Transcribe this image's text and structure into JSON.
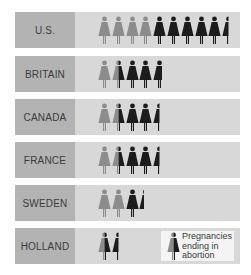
{
  "chart_data": {
    "type": "pictogram",
    "title": "",
    "unit_note": "each figure = one unit of pregnancies; grey = births, black = ending in abortion",
    "colors": {
      "label_bg": "#b3b3b3",
      "bar_bg": "#d8d8d8",
      "births": "#8c8c8c",
      "abortion": "#1c1c1c",
      "legend_bg": "#f4f4f4"
    },
    "categories": [
      "U.S.",
      "BRITAIN",
      "CANADA",
      "FRANCE",
      "SWEDEN",
      "HOLLAND"
    ],
    "series": [
      {
        "name": "Births (grey)",
        "values": [
          4,
          1.5,
          1.5,
          1.5,
          2,
          0.5
        ]
      },
      {
        "name": "Pregnancies ending in abortion (black)",
        "values": [
          5.5,
          2.7,
          2.5,
          2.5,
          1.4,
          1.0
        ]
      }
    ],
    "legend": {
      "label": "Pregnancies ending in abortion",
      "lines": [
        "Pregnancies",
        "ending in",
        "abortion"
      ]
    }
  },
  "rows": [
    {
      "label": "U.S.",
      "figures": [
        {
          "g": 1
        },
        {
          "g": 1
        },
        {
          "g": 1
        },
        {
          "g": 1
        },
        {
          "b": 1
        },
        {
          "b": 1
        },
        {
          "b": 1
        },
        {
          "b": 1
        },
        {
          "b": 1
        },
        {
          "b": 0.5
        }
      ]
    },
    {
      "label": "BRITAIN",
      "figures": [
        {
          "g": 1
        },
        {
          "g": 0.5,
          "b": 0.5
        },
        {
          "b": 1
        },
        {
          "b": 1
        },
        {
          "b": 0.7
        }
      ]
    },
    {
      "label": "CANADA",
      "figures": [
        {
          "g": 1
        },
        {
          "g": 0.5,
          "b": 0.5
        },
        {
          "b": 1
        },
        {
          "b": 1
        },
        {
          "b": 0.5
        }
      ]
    },
    {
      "label": "FRANCE",
      "figures": [
        {
          "g": 1
        },
        {
          "g": 0.5,
          "b": 0.5
        },
        {
          "b": 1
        },
        {
          "b": 1
        },
        {
          "b": 0.5
        }
      ]
    },
    {
      "label": "SWEDEN",
      "figures": [
        {
          "g": 1
        },
        {
          "g": 1
        },
        {
          "b": 1
        },
        {
          "b": 0.4
        }
      ]
    },
    {
      "label": "HOLLAND",
      "figures": [
        {
          "g": 0.5,
          "b": 0.5
        },
        {
          "b": 0.5
        }
      ]
    }
  ]
}
